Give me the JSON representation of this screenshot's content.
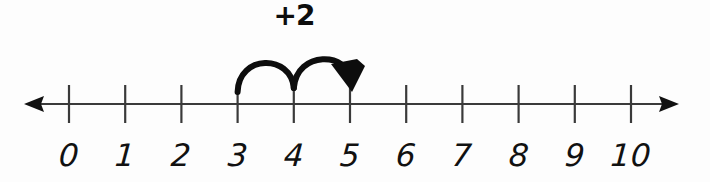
{
  "figure": {
    "kind": "number-line-diagram",
    "background_color": "#fdfdfd",
    "ink_color": "#111111",
    "axis_color": "#3a3a3a"
  },
  "number_line": {
    "min": 0,
    "max": 10,
    "tick_values": [
      0,
      1,
      2,
      3,
      4,
      5,
      6,
      7,
      8,
      9,
      10
    ],
    "tick_labels": [
      "0",
      "1",
      "2",
      "3",
      "4",
      "5",
      "6",
      "7",
      "8",
      "9",
      "10"
    ],
    "left_arrow": "arrow-left",
    "right_arrow": "arrow-right",
    "axis_y": 104,
    "tick_top": 85,
    "tick_bottom": 123,
    "first_tick_x": 69,
    "tick_spacing": 56.2
  },
  "jump": {
    "label": "+2",
    "label_x": 294,
    "label_y": 2,
    "start_value": 3,
    "end_value": 5,
    "hops": [
      {
        "from": 3,
        "to": 4
      },
      {
        "from": 4,
        "to": 5
      }
    ],
    "arrowhead": "arrowhead-down-right",
    "stroke_color": "#0d0d0d"
  }
}
